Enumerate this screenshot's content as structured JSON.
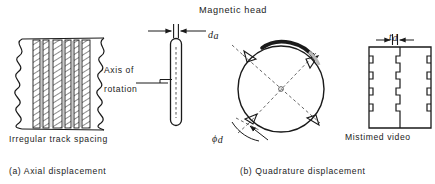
{
  "figure": {
    "title_top": "Magnetic head",
    "panels": [
      {
        "id": "a",
        "caption": "(a) Axial displacement",
        "sub_caption": "Irregular track spacing",
        "dimension_label": "d",
        "dimension_subscript": "a",
        "axis_label_line1": "Axis of",
        "axis_label_line2": "rotation"
      },
      {
        "id": "b",
        "caption": "(b) Quadrature displacement",
        "sub_caption": "Mistimed video",
        "dimension_label": "t",
        "dimension_subscript": "d",
        "angle_label": "ϕ",
        "angle_subscript": "d"
      }
    ]
  },
  "colors": {
    "ink": "#1a1a1a",
    "paper": "#ffffff",
    "hatch": "#2b2b2b",
    "dashed": "#555555"
  },
  "icons": {
    "track_block": "hatched-track-band",
    "head_bar": "magnetic-head-bar",
    "rotation_circle": "rotation-circle",
    "video_block": "mistimed-video-block",
    "arc_arrow": "rotation-arrow"
  }
}
